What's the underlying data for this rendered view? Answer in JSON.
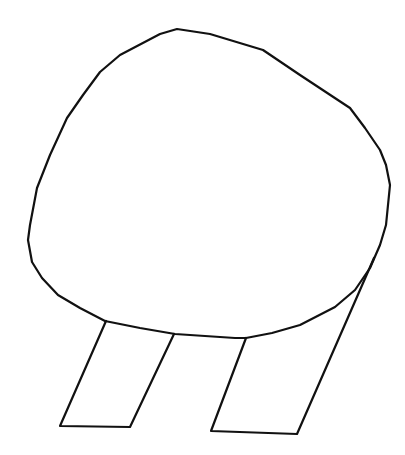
{
  "drawing": {
    "subject": "line drawing of a rounded body with two slanted legs",
    "stroke_color": "#111111",
    "background_color": "#ffffff",
    "parts": [
      "body-outline",
      "left-leg",
      "right-leg"
    ]
  }
}
